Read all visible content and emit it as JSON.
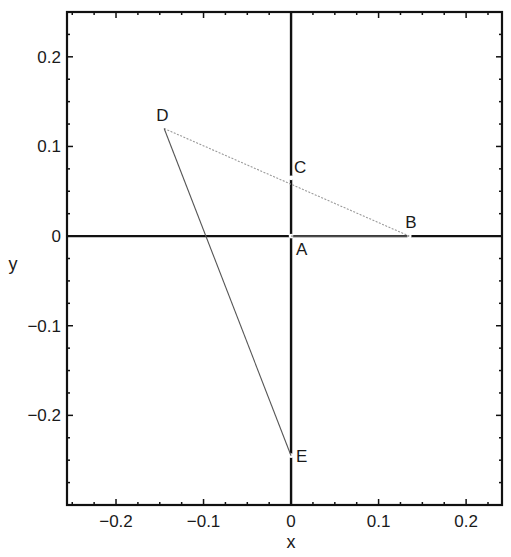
{
  "chart_data": {
    "type": "scatter",
    "title": "",
    "xlabel": "x",
    "ylabel": "y",
    "xlim": [
      -0.256,
      0.241
    ],
    "ylim": [
      -0.3,
      0.25
    ],
    "grid": false,
    "legend": null,
    "xticks": [
      -0.2,
      -0.1,
      0,
      0.1,
      0.2
    ],
    "xtick_labels": [
      "−0.2",
      "−0.1",
      "0",
      "0.1",
      "0.2"
    ],
    "yticks": [
      0.2,
      0.1,
      0,
      -0.1,
      -0.2
    ],
    "ytick_labels": [
      "0.2",
      "0.1",
      "0",
      "−0.1",
      "−0.2"
    ],
    "points": [
      {
        "label": "A",
        "x": 0.0,
        "y": 0.0
      },
      {
        "label": "B",
        "x": 0.135,
        "y": 0.0
      },
      {
        "label": "C",
        "x": 0.0,
        "y": 0.065
      },
      {
        "label": "D",
        "x": -0.145,
        "y": 0.12
      },
      {
        "label": "E",
        "x": 0.0,
        "y": -0.245
      }
    ],
    "segments": [
      {
        "from": "D",
        "to": "B",
        "style": "dotted-light",
        "passes_through": "C"
      },
      {
        "from": "D",
        "to": "E",
        "style": "thin-solid"
      },
      {
        "from": "A",
        "to": "B",
        "style": "double-line"
      }
    ],
    "reference_lines": [
      {
        "type": "horizontal",
        "y": 0,
        "style": "thick-solid"
      },
      {
        "type": "vertical",
        "x": 0,
        "style": "thick-solid"
      }
    ]
  }
}
